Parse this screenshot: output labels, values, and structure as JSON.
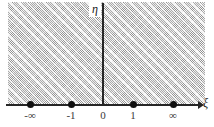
{
  "figure": {
    "name": "complex-plane-half-plane-diagram",
    "background_color": "#ffffff",
    "shaded_region": {
      "label": "hatched-shaded-plane",
      "fill_color": "#d2d2d2",
      "hatch_color": "#787878"
    },
    "axes": {
      "horizontal": {
        "name": "xi-axis",
        "label": "ξ",
        "line_color": "#262626"
      },
      "vertical": {
        "name": "eta-axis",
        "label": "η",
        "line_color": "#262626"
      }
    },
    "markers": [
      {
        "label": "-∞",
        "x": 30,
        "filled": true
      },
      {
        "label": "-1",
        "x": 71,
        "filled": true
      },
      {
        "label": "1",
        "x": 133,
        "filled": true
      },
      {
        "label": "∞",
        "x": 173,
        "filled": true
      }
    ],
    "ticks": [
      {
        "label": "-∞",
        "x": 30
      },
      {
        "label": "-1",
        "x": 71
      },
      {
        "label": "0",
        "x": 103
      },
      {
        "label": "1",
        "x": 133
      },
      {
        "label": "∞",
        "x": 173
      }
    ]
  }
}
